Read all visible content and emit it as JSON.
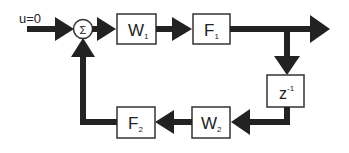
{
  "diagram": {
    "input_label": "u=0",
    "sum_symbol": "Σ",
    "blocks": [
      {
        "id": "w1",
        "main": "W",
        "sub": "1"
      },
      {
        "id": "f1",
        "main": "F",
        "sub": "1"
      },
      {
        "id": "delay",
        "main": "z",
        "sup": "-1"
      },
      {
        "id": "w2",
        "main": "W",
        "sub": "2"
      },
      {
        "id": "f2",
        "main": "F",
        "sub": "2"
      }
    ],
    "colors": {
      "line": "#222222",
      "box_border": "#333333",
      "background": "#ffffff"
    }
  }
}
